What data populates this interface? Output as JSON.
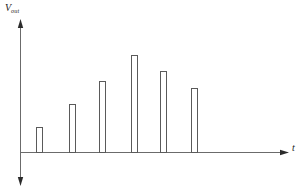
{
  "figure": {
    "name": "vout-vs-time-pulse-train",
    "background_color": "#ffffff",
    "stroke_color": "#5a5a5a",
    "axis_color": "#6b6b6b"
  },
  "labels": {
    "y_axis_symbol": "V",
    "y_axis_subscript": "out",
    "x_axis_symbol": "t"
  },
  "chart_data": {
    "type": "bar",
    "title": "",
    "subtitle": "",
    "xlabel": "t",
    "ylabel": "V_out",
    "grid": false,
    "legend": null,
    "categories": [
      "1",
      "2",
      "3",
      "4",
      "5",
      "6"
    ],
    "values": [
      0.2,
      0.42,
      0.62,
      0.87,
      0.72,
      0.57
    ],
    "x": [
      36,
      69,
      99,
      131,
      160,
      191
    ],
    "bar_width_px": 6,
    "baseline_y_px": 152,
    "top_y_px": [
      127,
      104,
      81,
      55,
      71,
      88
    ],
    "xlim": [
      0,
      303
    ],
    "ylim": [
      0,
      1
    ],
    "annotations": []
  }
}
